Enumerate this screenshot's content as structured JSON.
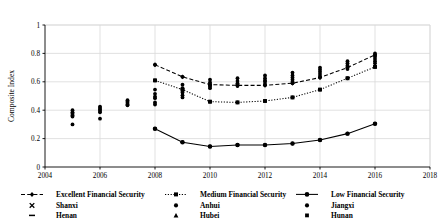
{
  "chart_data": {
    "type": "line",
    "title": "",
    "subtitle": "",
    "xlabel": "",
    "ylabel": "Composite Index",
    "xlim": [
      2004,
      2018
    ],
    "ylim": [
      0,
      1
    ],
    "grid": true,
    "legend_position": "bottom",
    "x_ticks": [
      "2004",
      "2006",
      "2008",
      "2010",
      "2012",
      "2014",
      "2016",
      "2018"
    ],
    "x_tick_values": [
      2004,
      2006,
      2008,
      2010,
      2012,
      2014,
      2016,
      2018
    ],
    "y_ticks": [
      "0",
      "0.2",
      "0.4",
      "0.6",
      "0.8",
      "1"
    ],
    "y_tick_values": [
      0,
      0.2,
      0.4,
      0.6,
      0.8,
      1
    ],
    "x": [
      2008,
      2009,
      2010,
      2011,
      2012,
      2013,
      2014,
      2015,
      2016
    ],
    "series": [
      {
        "name": "Excellent Financial Security",
        "marker": "diamond",
        "linestyle": "dashed",
        "color": "#000000",
        "values": [
          0.72,
          0.635,
          0.58,
          0.575,
          0.575,
          0.59,
          0.63,
          0.7,
          0.79
        ]
      },
      {
        "name": "Medium Financial Security",
        "marker": "square",
        "linestyle": "dotted",
        "color": "#000000",
        "values": [
          0.61,
          0.545,
          0.46,
          0.455,
          0.465,
          0.49,
          0.545,
          0.625,
          0.705
        ]
      },
      {
        "name": "Low Financial Security",
        "marker": "circle",
        "linestyle": "solid",
        "color": "#000000",
        "values": [
          0.27,
          0.175,
          0.145,
          0.155,
          0.155,
          0.165,
          0.19,
          0.235,
          0.305
        ]
      }
    ],
    "scatter_groups": [
      {
        "x": 2005,
        "values": [
          0.4,
          0.385,
          0.375,
          0.365,
          0.355,
          0.3
        ]
      },
      {
        "x": 2006,
        "values": [
          0.425,
          0.415,
          0.405,
          0.395,
          0.385,
          0.34
        ]
      },
      {
        "x": 2007,
        "values": [
          0.47,
          0.46,
          0.45,
          0.44,
          0.435
        ]
      },
      {
        "x": 2008,
        "values": [
          0.72,
          0.61,
          0.545,
          0.515,
          0.495,
          0.485,
          0.455,
          0.44,
          0.27
        ]
      },
      {
        "x": 2009,
        "values": [
          0.635,
          0.58,
          0.555,
          0.545,
          0.525,
          0.505,
          0.49,
          0.175
        ]
      },
      {
        "x": 2010,
        "values": [
          0.615,
          0.595,
          0.585,
          0.575,
          0.565,
          0.555,
          0.46,
          0.145
        ]
      },
      {
        "x": 2011,
        "values": [
          0.625,
          0.605,
          0.59,
          0.58,
          0.57,
          0.455,
          0.155
        ]
      },
      {
        "x": 2012,
        "values": [
          0.645,
          0.625,
          0.61,
          0.6,
          0.585,
          0.575,
          0.465,
          0.155
        ]
      },
      {
        "x": 2013,
        "values": [
          0.665,
          0.645,
          0.63,
          0.615,
          0.6,
          0.59,
          0.49,
          0.165
        ]
      },
      {
        "x": 2014,
        "values": [
          0.7,
          0.685,
          0.67,
          0.655,
          0.64,
          0.63,
          0.545,
          0.19
        ]
      },
      {
        "x": 2015,
        "values": [
          0.745,
          0.73,
          0.715,
          0.705,
          0.69,
          0.625,
          0.235
        ]
      },
      {
        "x": 2016,
        "values": [
          0.8,
          0.785,
          0.775,
          0.76,
          0.745,
          0.73,
          0.705,
          0.305
        ]
      }
    ]
  },
  "legend": {
    "rows": [
      [
        {
          "label": "Excellent Financial Security",
          "marker": "diamond-dashed-line"
        },
        {
          "label": "Medium Financial Security",
          "marker": "square-dotted-line"
        },
        {
          "label": "Low Financial Security",
          "marker": "circle-solid-line"
        }
      ],
      [
        {
          "label": "Shanxi",
          "marker": "cross"
        },
        {
          "label": "Anhui",
          "marker": "dot"
        },
        {
          "label": "Jiangxi",
          "marker": "dot"
        }
      ],
      [
        {
          "label": "Henan",
          "marker": "dash"
        },
        {
          "label": "Hubei",
          "marker": "triangle"
        },
        {
          "label": "Hunan",
          "marker": "square"
        }
      ]
    ]
  },
  "style": {
    "axis_color": "#000000",
    "grid_color": "#d9d9d9",
    "plot_background": "#ffffff"
  }
}
